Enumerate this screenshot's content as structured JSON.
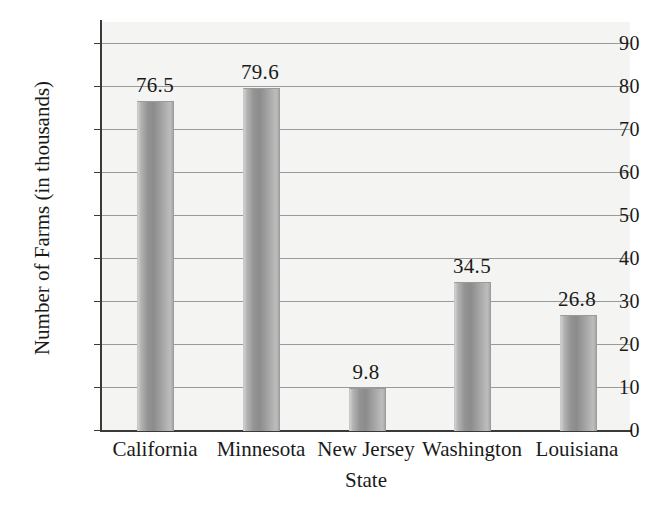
{
  "chart_data": {
    "type": "bar",
    "title": "",
    "xlabel": "State",
    "ylabel": "Number of Farms (in thousands)",
    "categories": [
      "California",
      "Minnesota",
      "New Jersey",
      "Washington",
      "Louisiana"
    ],
    "values": [
      76.5,
      79.6,
      9.8,
      34.5,
      26.8
    ],
    "value_labels": [
      "76.5",
      "79.6",
      "9.8",
      "34.5",
      "26.8"
    ],
    "ylim": [
      0,
      95
    ],
    "ytick_values": [
      0,
      10,
      20,
      30,
      40,
      50,
      60,
      70,
      80,
      90
    ],
    "ytick_labels": [
      "0",
      "10",
      "20",
      "30",
      "40",
      "50",
      "60",
      "70",
      "80",
      "90"
    ],
    "grid": true,
    "legend": false,
    "bar_color": "#9a9a9a",
    "plot_background": "#f4f4f2",
    "axis_color": "#3a3a3a",
    "gridline_color": "#9a9a9a"
  }
}
